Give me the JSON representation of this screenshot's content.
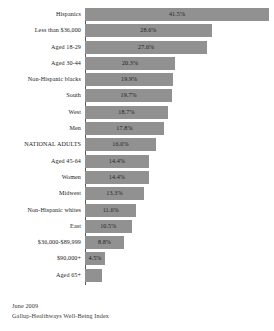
{
  "chart_data": {
    "type": "bar",
    "orientation": "horizontal",
    "title": "",
    "subtitle": "",
    "xlabel": "",
    "ylabel": "",
    "xlim": [
      0,
      41.5
    ],
    "grid": false,
    "legend": null,
    "value_suffix": "%",
    "categories": [
      "Hispanics",
      "Less than $36,000",
      "Aged 18-29",
      "Aged 30-44",
      "Non-Hispanic blacks",
      "South",
      "West",
      "Men",
      "NATIONAL ADULTS",
      "Aged 45-64",
      "Women",
      "Midwest",
      "Non-Hispanic whites",
      "East",
      "$36,000-$89,999",
      "$90,000+",
      "Aged 65+"
    ],
    "values": [
      41.5,
      28.6,
      27.6,
      20.3,
      19.9,
      19.7,
      18.7,
      17.8,
      16.0,
      14.4,
      14.4,
      13.3,
      11.6,
      10.5,
      8.8,
      4.5,
      3.8
    ],
    "value_labels": [
      "41.5%",
      "28.6%",
      "27.6%",
      "20.3%",
      "19.9%",
      "19.7%",
      "18.7%",
      "17.8%",
      "16.0%",
      "14.4%",
      "14.4%",
      "13.3%",
      "11.6%",
      "10.5%",
      "8.8%",
      "4.5%",
      ""
    ],
    "bar_color": "#919191",
    "axis_color": "#5a5a5a"
  },
  "footer": {
    "date": "June 2009",
    "source": "Gallup-Healthways Well-Being Index"
  }
}
